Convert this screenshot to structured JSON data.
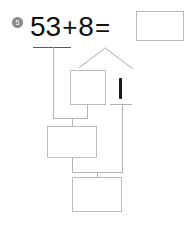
{
  "page": {
    "background_color": "#ffffff",
    "width": 190,
    "height": 226
  },
  "problem": {
    "number_badge": "5",
    "badge_color": "#8a8a8a",
    "equation": {
      "left_operand": "53",
      "operator_plus": "+",
      "right_operand": "8",
      "operator_equals": "=",
      "answer_value": ""
    }
  },
  "number_bond": {
    "description": "decomposition of 8 into two parts",
    "left_part_value": "",
    "right_part_value": "1"
  },
  "work_boxes": [
    {
      "name": "bond-left-part-box",
      "value": ""
    },
    {
      "name": "intermediate-sum-box",
      "value": ""
    },
    {
      "name": "final-answer-box",
      "value": ""
    }
  ],
  "colors": {
    "line": "#b4b4b4",
    "box_border": "#bdbdbd",
    "ink": "#111111",
    "rule": "#5a5a5a"
  }
}
